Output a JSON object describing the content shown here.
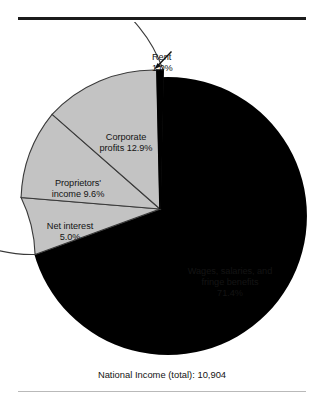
{
  "figure": {
    "caption": "National Income (total): 10,904",
    "rules": {
      "top_color": "#1b1b1b",
      "bottom_color": "#b9b9b9"
    }
  },
  "callout": {
    "name": "rent-callout",
    "line1": "Rent",
    "line2": "1.0%"
  },
  "labels": {
    "corporate": "Corporate\nprofits 12.9%",
    "proprietors": "Proprietors'\nincome 9.6%",
    "net_interest": "Net interest\n5.0%",
    "wages": "Wages, salaries, and\nfringe benefits\n71.4%"
  },
  "chart_data": {
    "type": "pie",
    "title": "National Income (total): 10,904",
    "total_label": "National Income (total)",
    "total_value": "10,904",
    "units": "percent of national income",
    "legend": "none (labels placed on/near slices)",
    "start_angle_deg": -90,
    "direction": "clockwise",
    "categories": [
      "Rent",
      "Wages, salaries, and fringe benefits",
      "Net interest",
      "Proprietors' income",
      "Corporate profits"
    ],
    "values": [
      1.0,
      71.4,
      5.0,
      9.6,
      12.9
    ],
    "value_labels": [
      "1.0%",
      "71.4%",
      "5.0%",
      "9.6%",
      "12.9%"
    ],
    "slices": [
      {
        "name": "Rent",
        "value": 1.0,
        "label": "Rent",
        "value_label": "1.0%",
        "fill": "#000000",
        "stroke": "#000000",
        "callout": true
      },
      {
        "name": "Wages, salaries, and fringe benefits",
        "value": 71.4,
        "label": "Wages, salaries, and fringe benefits",
        "value_label": "71.4%",
        "fill": "#ffffff",
        "stroke": "#3a3a3a",
        "callout": false
      },
      {
        "name": "Net interest",
        "value": 5.0,
        "label": "Net interest",
        "value_label": "5.0%",
        "fill": "#c3c3c3",
        "stroke": "#3a3a3a",
        "callout": false
      },
      {
        "name": "Proprietors' income",
        "value": 9.6,
        "label": "Proprietors' income",
        "value_label": "9.6%",
        "fill": "#c3c3c3",
        "stroke": "#3a3a3a",
        "callout": false
      },
      {
        "name": "Corporate profits",
        "value": 12.9,
        "label": "Corporate profits",
        "value_label": "12.9%",
        "fill": "#c3c3c3",
        "stroke": "#3a3a3a",
        "callout": false
      }
    ],
    "shadow": {
      "color": "#000000",
      "position": "right-bottom offset crescent"
    }
  },
  "colors": {
    "slice_gray": "#c3c3c3",
    "slice_white": "#ffffff",
    "slice_black": "#000000",
    "outline": "#3a3a3a",
    "text": "#141414",
    "rule_top": "#1b1b1b",
    "rule_bottom": "#b9b9b9",
    "background": "#ffffff"
  }
}
